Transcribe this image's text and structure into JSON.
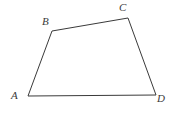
{
  "figure": {
    "type": "geometric-diagram",
    "shape": "quadrilateral",
    "name": "ABCD",
    "background_color": "#ffffff",
    "stroke_color": "#3a3a3a",
    "stroke_width": 1,
    "label_color": "#3a3a3a",
    "canvas": {
      "width": 175,
      "height": 113
    },
    "vertices": [
      {
        "id": "A",
        "label": "A",
        "x": 28,
        "y": 96,
        "label_x": 11,
        "label_y": 90
      },
      {
        "id": "B",
        "label": "B",
        "x": 52,
        "y": 31,
        "label_x": 42,
        "label_y": 16
      },
      {
        "id": "C",
        "label": "C",
        "x": 128,
        "y": 18,
        "label_x": 119,
        "label_y": 2
      },
      {
        "id": "D",
        "label": "D",
        "x": 156,
        "y": 95,
        "label_x": 157,
        "label_y": 93
      }
    ],
    "edges": [
      {
        "id": "AB",
        "from": "A",
        "to": "B"
      },
      {
        "id": "BC",
        "from": "B",
        "to": "C"
      },
      {
        "id": "CD",
        "from": "C",
        "to": "D"
      },
      {
        "id": "DA",
        "from": "D",
        "to": "A"
      }
    ],
    "path": "M 28 96 L 52 31 L 128 18 L 156 95 Z"
  }
}
